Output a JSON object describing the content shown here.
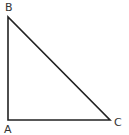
{
  "diagram": {
    "type": "right-triangle",
    "stroke_color": "#222222",
    "vertices": {
      "A": {
        "label": "A",
        "x": 8,
        "y": 120
      },
      "B": {
        "label": "B",
        "x": 8,
        "y": 17
      },
      "C": {
        "label": "C",
        "x": 110,
        "y": 120
      }
    },
    "labels": {
      "A": "A",
      "B": "B",
      "C": "C"
    },
    "right_angle_at": "A"
  }
}
